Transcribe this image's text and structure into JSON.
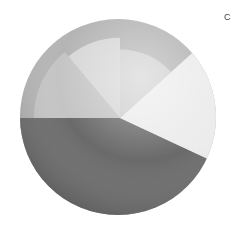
{
  "panel": {
    "label": "C"
  },
  "chart_data": {
    "type": "pie",
    "subtype": "polar-area-on-shaded-sphere",
    "title": "",
    "center": [
      120,
      118
    ],
    "sphere_radius": 98,
    "legend": [],
    "grid": false,
    "wedges": [
      {
        "name": "bottom",
        "start_deg": 25,
        "end_deg": 180,
        "radius_frac": 1.0,
        "shade": "#6a6a6a"
      },
      {
        "name": "left",
        "start_deg": 180,
        "end_deg": 230,
        "radius_frac": 0.88,
        "shade": "#c4c4c4"
      },
      {
        "name": "tall-upper",
        "start_deg": 230,
        "end_deg": 270,
        "radius_frac": 0.82,
        "shade": "#d6d6d6"
      },
      {
        "name": "upper-right",
        "start_deg": 270,
        "end_deg": 318,
        "radius_frac": 0.7,
        "shade": "#cfcfcf"
      },
      {
        "name": "bright",
        "start_deg": 318,
        "end_deg": 385,
        "radius_frac": 1.0,
        "shade": "#ececec"
      }
    ],
    "background_shade": "#b4b4b4",
    "angle_convention": "degrees clockwise from 3 o'clock (screen coordinates)"
  }
}
